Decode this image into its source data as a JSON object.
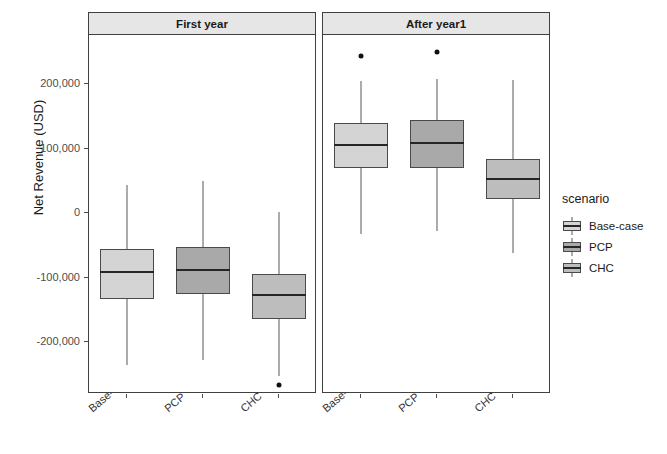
{
  "chart_data": {
    "type": "box",
    "title": "",
    "xlabel": "",
    "ylabel": "Net Revenue (USD)",
    "ylim": [
      -290000,
      268000
    ],
    "yticks": [
      200000,
      100000,
      0,
      -100000,
      -200000
    ],
    "ytick_labels": [
      "200,000",
      "100,000",
      "0",
      "-100,000",
      "-200,000"
    ],
    "grid": false,
    "legend": {
      "title": "scenario",
      "position": "right",
      "entries": [
        "Base-case",
        "PCP",
        "CHC"
      ]
    },
    "facets": [
      "First year",
      "After year1"
    ],
    "categories": [
      "Base-case",
      "PCP",
      "CHC"
    ],
    "colors": {
      "Base-case": "#d4d4d4",
      "PCP": "#a9a9a9",
      "CHC": "#bdbdbd"
    },
    "panels": [
      {
        "facet": "First year",
        "boxes": [
          {
            "category": "Base-case",
            "whisker_low": -236000,
            "q1": -133000,
            "median": -92000,
            "q3": -56000,
            "whisker_high": 44000,
            "outliers": []
          },
          {
            "category": "PCP",
            "whisker_low": -228000,
            "q1": -126000,
            "median": -88000,
            "q3": -52000,
            "whisker_high": 50000,
            "outliers": []
          },
          {
            "category": "CHC",
            "whisker_low": -253000,
            "q1": -164000,
            "median": -127000,
            "q3": -95000,
            "whisker_high": 2000,
            "outliers": [
              -266000
            ]
          }
        ]
      },
      {
        "facet": "After year1",
        "boxes": [
          {
            "category": "Base-case",
            "whisker_low": -33000,
            "q1": 69000,
            "median": 105000,
            "q3": 139000,
            "whisker_high": 205000,
            "outliers": [
              244000
            ]
          },
          {
            "category": "PCP",
            "whisker_low": -28000,
            "q1": 70000,
            "median": 108000,
            "q3": 144000,
            "whisker_high": 207000,
            "outliers": [
              250000
            ]
          },
          {
            "category": "CHC",
            "whisker_low": -62000,
            "q1": 22000,
            "median": 53000,
            "q3": 83000,
            "whisker_high": 206000,
            "outliers": []
          }
        ]
      }
    ]
  }
}
